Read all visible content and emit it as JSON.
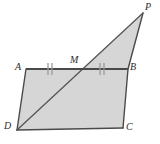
{
  "figure": {
    "canvas": {
      "width": 160,
      "height": 144
    },
    "colors": {
      "fill": "#d6d6d6",
      "stroke": "#4a4a4a",
      "diagonal_stroke": "#555555",
      "tick_stroke": "#9a9a9a",
      "label": "#2b2b2b",
      "background": "#ffffff"
    },
    "vertices": [
      {
        "name": "P",
        "label": "P",
        "x": 143,
        "y": 13
      },
      {
        "name": "A",
        "label": "A",
        "x": 26,
        "y": 69
      },
      {
        "name": "M",
        "label": "M",
        "x": 76,
        "y": 69
      },
      {
        "name": "B",
        "label": "B",
        "x": 128,
        "y": 69
      },
      {
        "name": "C",
        "label": "C",
        "x": 123,
        "y": 128
      },
      {
        "name": "D",
        "label": "D",
        "x": 17,
        "y": 130
      }
    ],
    "polygons": [
      {
        "name": "parallelogram-abcd",
        "points": "26,69 128,69 123,128 17,130"
      },
      {
        "name": "triangle-dpb",
        "points": "17,130 143,13 128,69"
      }
    ],
    "segments": [
      {
        "name": "segment-ab",
        "x1": 26,
        "y1": 69,
        "x2": 128,
        "y2": 69
      },
      {
        "name": "segment-ad",
        "x1": 26,
        "y1": 69,
        "x2": 17,
        "y2": 130
      },
      {
        "name": "segment-dc",
        "x1": 17,
        "y1": 130,
        "x2": 123,
        "y2": 128
      },
      {
        "name": "segment-bc",
        "x1": 128,
        "y1": 69,
        "x2": 123,
        "y2": 128
      },
      {
        "name": "segment-bp",
        "x1": 128,
        "y1": 69,
        "x2": 143,
        "y2": 13
      },
      {
        "name": "segment-dp",
        "x1": 17,
        "y1": 130,
        "x2": 143,
        "y2": 13
      }
    ],
    "tick_marks": [
      {
        "name": "tick-am-1",
        "x": 48,
        "y1": 63,
        "y2": 75
      },
      {
        "name": "tick-am-2",
        "x": 52,
        "y1": 63,
        "y2": 75
      },
      {
        "name": "tick-mb-1",
        "x": 100,
        "y1": 63,
        "y2": 75
      },
      {
        "name": "tick-mb-2",
        "x": 104,
        "y1": 63,
        "y2": 75
      }
    ]
  }
}
